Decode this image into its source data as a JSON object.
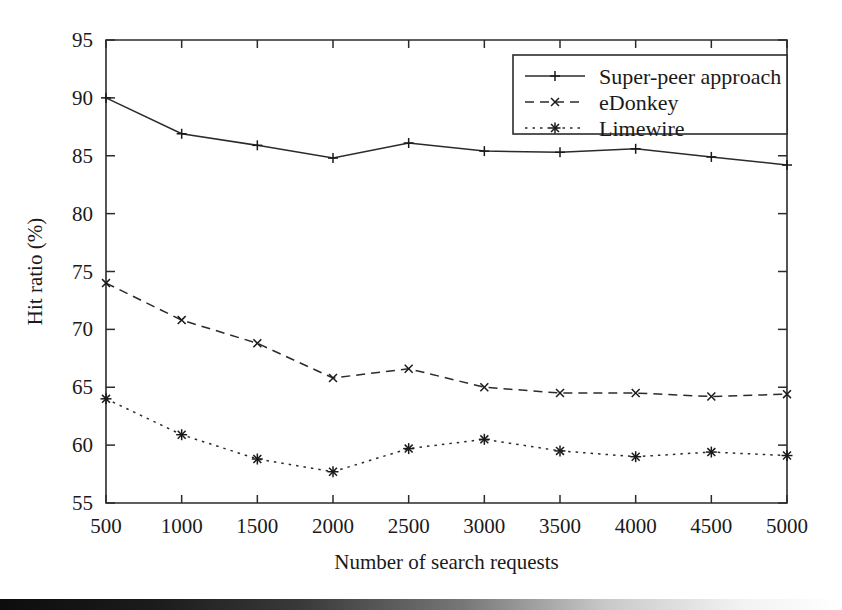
{
  "chart_data": {
    "type": "line",
    "title": "",
    "xlabel": "Number of search requests",
    "ylabel": "Hit ratio (%)",
    "x": [
      500,
      1000,
      1500,
      2000,
      2500,
      3000,
      3500,
      4000,
      4500,
      5000
    ],
    "xticklabels": [
      "500",
      "1000",
      "1500",
      "2000",
      "2500",
      "3000",
      "3500",
      "4000",
      "4500",
      "5000"
    ],
    "yticklabels": [
      "55",
      "60",
      "65",
      "70",
      "75",
      "80",
      "85",
      "90",
      "95"
    ],
    "yticks": [
      55,
      60,
      65,
      70,
      75,
      80,
      85,
      90,
      95
    ],
    "xlim": [
      500,
      5000
    ],
    "ylim": [
      55,
      95
    ],
    "grid": false,
    "legend_position": "top-right",
    "series": [
      {
        "name": "Super-peer approach",
        "style": "solid",
        "marker": "plus",
        "values": [
          90.0,
          86.9,
          85.9,
          84.8,
          86.1,
          85.4,
          85.3,
          85.6,
          84.9,
          84.2
        ]
      },
      {
        "name": "eDonkey",
        "style": "dashed",
        "marker": "cross",
        "values": [
          74.0,
          70.8,
          68.8,
          65.8,
          66.6,
          65.0,
          64.5,
          64.5,
          64.2,
          64.4
        ]
      },
      {
        "name": "Limewire",
        "style": "dotted",
        "marker": "asterisk",
        "values": [
          64.0,
          60.9,
          58.8,
          57.7,
          59.7,
          60.5,
          59.5,
          59.0,
          59.4,
          59.1
        ]
      }
    ]
  },
  "figure": {
    "line_color": "#2b2b2b",
    "background_color": "#ffffff",
    "scan_artifact": "bottom-edge-dark-gradient-bar"
  }
}
